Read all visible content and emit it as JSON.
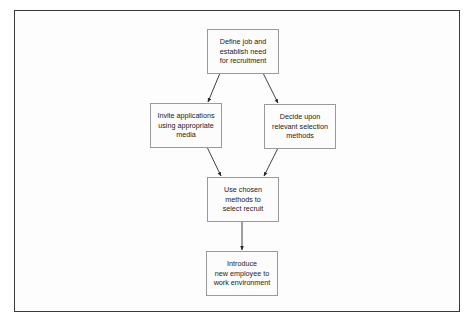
{
  "diagram": {
    "type": "flowchart",
    "colors": {
      "frame_border": "#3a3a3a",
      "node_border": "#9a9a9a",
      "arrow": "#2a2a2a",
      "text": "#222222"
    },
    "nodes": [
      {
        "id": "define",
        "label": "Define job and\nestablish need\nfor recruitment"
      },
      {
        "id": "invite",
        "label": "Invite applications\nusing appropriate\nmedia"
      },
      {
        "id": "decide",
        "label": "Decide upon\nrelevant selection\nmethods"
      },
      {
        "id": "use",
        "label": "Use chosen\nmethods to\nselect recruit"
      },
      {
        "id": "introduce",
        "label": "Introduce\nnew employee to\nwork environment"
      }
    ],
    "edges": [
      {
        "from": "define",
        "to": "invite"
      },
      {
        "from": "define",
        "to": "decide"
      },
      {
        "from": "invite",
        "to": "use"
      },
      {
        "from": "decide",
        "to": "use"
      },
      {
        "from": "use",
        "to": "introduce"
      }
    ]
  },
  "caption": {
    "text": ""
  }
}
